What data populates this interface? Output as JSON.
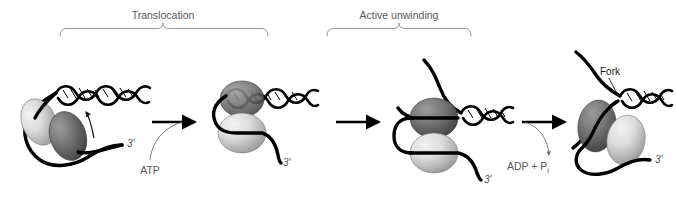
{
  "figure": {
    "background_color": "#ffffff",
    "width": 676,
    "height": 197
  },
  "phases": [
    {
      "id": "translocation",
      "label": "Translocation",
      "label_x": 163,
      "label_y": 17,
      "bracket_left": 60,
      "bracket_right": 268,
      "bracket_y": 28
    },
    {
      "id": "active-unwinding",
      "label": "Active unwinding",
      "label_x": 399,
      "label_y": 17,
      "bracket_left": 327,
      "bracket_right": 471,
      "bracket_y": 28
    }
  ],
  "annotations": {
    "fork": {
      "label": "Fork",
      "x": 610,
      "y": 74
    },
    "atp": {
      "label": "ATP",
      "x": 150,
      "y": 172
    },
    "adp": {
      "label": "ADP + P",
      "subscript": "i",
      "x": 528,
      "y": 167
    }
  },
  "prime_labels": [
    {
      "label": "3'",
      "x": 127,
      "y": 147,
      "stage": 1
    },
    {
      "label": "3'",
      "x": 283,
      "y": 164,
      "stage": 2
    },
    {
      "label": "3'",
      "x": 491,
      "y": 180,
      "stage": 3
    },
    {
      "label": "3'",
      "x": 655,
      "y": 165,
      "stage": 4
    }
  ],
  "stages": [
    {
      "id": "stage-1-translocation-start",
      "name": "Helicase bound to single-stranded tail, duplex ahead",
      "subunits": [
        {
          "id": "subunit-light",
          "shade": "light",
          "color_light": "#e8e8e8",
          "color_dark": "#9d9d9d",
          "cx": 39,
          "cy": 122,
          "rx": 17,
          "ry": 24,
          "rotate": -22
        },
        {
          "id": "subunit-dark",
          "shade": "dark",
          "color_light": "#8a8a8a",
          "color_dark": "#4a4a4a",
          "cx": 68,
          "cy": 136,
          "rx": 18,
          "ry": 25,
          "rotate": -18
        }
      ],
      "duplex_turns": 5,
      "has_rotation_arrow": true
    },
    {
      "id": "stage-2-translocation-end",
      "name": "Helicase translocated to duplex junction",
      "subunits": [
        {
          "id": "subunit-dark",
          "shade": "dark",
          "color_light": "#8a8a8a",
          "color_dark": "#4a4a4a",
          "cx": 242,
          "cy": 99,
          "rx": 22,
          "ry": 18,
          "rotate": 0
        },
        {
          "id": "subunit-light",
          "shade": "light",
          "color_light": "#e8e8e8",
          "color_dark": "#9d9d9d",
          "cx": 242,
          "cy": 133,
          "rx": 24,
          "ry": 20,
          "rotate": 0
        }
      ],
      "duplex_turns": 4,
      "has_rotation_arrow": false
    },
    {
      "id": "stage-3-active-unwinding",
      "name": "Helicase actively unwinding duplex, both strands separated",
      "subunits": [
        {
          "id": "subunit-dark",
          "shade": "dark",
          "color_light": "#8a8a8a",
          "color_dark": "#4a4a4a",
          "cx": 434,
          "cy": 118,
          "rx": 24,
          "ry": 20,
          "rotate": 0
        },
        {
          "id": "subunit-light",
          "shade": "light",
          "color_light": "#e8e8e8",
          "color_dark": "#9d9d9d",
          "cx": 434,
          "cy": 153,
          "rx": 24,
          "ry": 20,
          "rotate": 0
        }
      ],
      "duplex_turns": 3,
      "has_rotation_arrow": false
    },
    {
      "id": "stage-4-fork",
      "name": "Helicase at replication fork after ATP hydrolysis",
      "subunits": [
        {
          "id": "subunit-dark",
          "shade": "dark",
          "color_light": "#8a8a8a",
          "color_dark": "#4a4a4a",
          "cx": 597,
          "cy": 126,
          "rx": 19,
          "ry": 26,
          "rotate": 8
        },
        {
          "id": "subunit-light",
          "shade": "light",
          "color_light": "#e8e8e8",
          "color_dark": "#9d9d9d",
          "cx": 626,
          "cy": 140,
          "rx": 19,
          "ry": 25,
          "rotate": 10
        }
      ],
      "duplex_turns": 3,
      "has_rotation_arrow": false
    }
  ],
  "reaction_arrows": [
    {
      "id": "arrow-1",
      "x1": 152,
      "y1": 122,
      "x2": 198,
      "y2": 122,
      "branch": "atp",
      "branch_direction": "in"
    },
    {
      "id": "arrow-2",
      "x1": 336,
      "y1": 122,
      "x2": 382,
      "y2": 122,
      "branch": null,
      "branch_direction": null
    },
    {
      "id": "arrow-3",
      "x1": 522,
      "y1": 122,
      "x2": 568,
      "y2": 122,
      "branch": "adp",
      "branch_direction": "out"
    }
  ],
  "colors": {
    "strand": "#000000",
    "bracket": "#8b8b8d",
    "label_gray": "#58585a",
    "label_black": "#1a1a1a",
    "subunit_light_hi": "#e8e8e8",
    "subunit_light_lo": "#9d9d9d",
    "subunit_dark_hi": "#8a8a8a",
    "subunit_dark_lo": "#4a4a4a"
  }
}
